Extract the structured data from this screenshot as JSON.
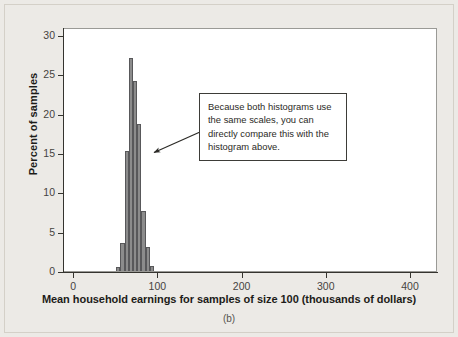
{
  "figure": {
    "caption": "(b)",
    "background_color": "#eceae6",
    "plot_background_color": "#ffffff",
    "bar_fill_color": "#8c8c8c",
    "bar_edge_color": "#58585a",
    "axis_color": "#35342f"
  },
  "callout": {
    "text": "Because both histograms use the same scales, you can directly compare this with the histogram above.",
    "border_color": "#3d3c38",
    "background_color": "#ffffff"
  },
  "chart_data": {
    "type": "bar",
    "title": "",
    "subtitle": "",
    "xlabel": "Mean household earnings for samples of size 100 (thousands of dollars)",
    "ylabel": "Percent of samples",
    "xlim": [
      -12,
      432
    ],
    "ylim": [
      0,
      31
    ],
    "xticks": [
      0,
      100,
      200,
      300,
      400
    ],
    "xtick_labels": [
      "0",
      "100",
      "200",
      "300",
      "400"
    ],
    "yticks": [
      0,
      5,
      10,
      15,
      20,
      25,
      30
    ],
    "ytick_labels": [
      "0",
      "5",
      "10",
      "15",
      "20",
      "25",
      "30"
    ],
    "grid": false,
    "legend": false,
    "legend_position": "none",
    "bin_width": 5,
    "bin_left_edges": [
      50,
      55,
      60,
      65,
      70,
      75,
      80,
      85,
      90
    ],
    "categories": [
      "50-55",
      "55-60",
      "60-65",
      "65-70",
      "70-75",
      "75-80",
      "80-85",
      "85-90",
      "90-95"
    ],
    "values": [
      0.5,
      3.5,
      15.3,
      27.0,
      24.2,
      18.7,
      7.6,
      3.0,
      0.7
    ],
    "annotations": [
      {
        "text": "Because both histograms use the same scales, you can directly compare this with the histogram above.",
        "points_to_x": 72,
        "points_to_y": 16
      }
    ]
  }
}
